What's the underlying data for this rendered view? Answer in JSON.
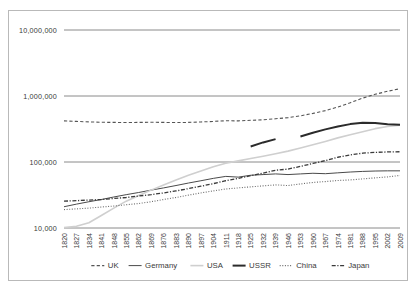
{
  "chart_data": {
    "type": "line",
    "title": "",
    "subtitle": "",
    "xlabel": "",
    "ylabel": "",
    "yscale": "log",
    "ylim": [
      10000,
      10000000
    ],
    "y_ticks": [
      10000,
      100000,
      1000000,
      10000000
    ],
    "y_tick_labels": [
      "10,000",
      "100,000",
      "1,000,000",
      "10,000,000"
    ],
    "grid": true,
    "legend_position": "bottom",
    "x": [
      1820,
      1827,
      1834,
      1841,
      1848,
      1855,
      1862,
      1869,
      1876,
      1883,
      1890,
      1897,
      1904,
      1911,
      1918,
      1925,
      1932,
      1939,
      1946,
      1953,
      1960,
      1967,
      1974,
      1981,
      1988,
      1995,
      2002,
      2009
    ],
    "x_tick_labels": [
      "1820",
      "1827",
      "1834",
      "1841",
      "1848",
      "1855",
      "1862",
      "1869",
      "1876",
      "1883",
      "1890",
      "1897",
      "1904",
      "1911",
      "1918",
      "1925",
      "1932",
      "1939",
      "1946",
      "1953",
      "1960",
      "1967",
      "1974",
      "1981",
      "1988",
      "1995",
      "2002",
      "2009"
    ],
    "series": [
      {
        "name": "UK",
        "style": "dashed",
        "color": "#555555",
        "width": 1.1,
        "values": [
          420000,
          412000,
          405000,
          400000,
          398000,
          397000,
          398000,
          400000,
          398000,
          396000,
          398000,
          404000,
          412000,
          422000,
          420000,
          428000,
          436000,
          452000,
          470000,
          500000,
          545000,
          600000,
          680000,
          790000,
          930000,
          1060000,
          1180000,
          1290000
        ]
      },
      {
        "name": "Germany",
        "style": "solid-thin",
        "color": "#4a4a4a",
        "width": 1.0,
        "values": [
          21000,
          23000,
          25000,
          27000,
          29500,
          32000,
          34500,
          37500,
          40500,
          44000,
          48000,
          52000,
          56500,
          60500,
          59000,
          63000,
          64500,
          66000,
          64500,
          66000,
          67500,
          66500,
          68500,
          70500,
          72000,
          73000,
          73500,
          73500
        ]
      },
      {
        "name": "USA",
        "style": "solid-light",
        "color": "#cfcfcf",
        "width": 1.6,
        "values": [
          10200,
          10600,
          12000,
          15500,
          20000,
          25500,
          31000,
          37500,
          45000,
          53500,
          63000,
          73000,
          85000,
          96000,
          104000,
          113000,
          122000,
          133000,
          146000,
          163000,
          182000,
          205000,
          232000,
          258000,
          288000,
          320000,
          345000,
          360000
        ]
      },
      {
        "name": "USSR",
        "style": "solid-thick",
        "color": "#2b2b2b",
        "width": 2.0,
        "values": [
          null,
          null,
          null,
          null,
          null,
          null,
          null,
          null,
          null,
          null,
          null,
          null,
          null,
          null,
          null,
          172000,
          198000,
          222000,
          null,
          244000,
          278000,
          312000,
          345000,
          375000,
          392000,
          390000,
          372000,
          368000
        ]
      },
      {
        "name": "China",
        "style": "dotted",
        "color": "#6a6a6a",
        "width": 1.1,
        "values": [
          19000,
          19500,
          20000,
          20800,
          21500,
          22500,
          23500,
          25000,
          27000,
          29000,
          31500,
          34000,
          36500,
          39000,
          40500,
          42000,
          43500,
          45000,
          44000,
          46500,
          49000,
          50500,
          52500,
          53500,
          55500,
          57500,
          59500,
          62500
        ]
      },
      {
        "name": "Japan",
        "style": "dash-dot",
        "color": "#3a3a3a",
        "width": 1.3,
        "values": [
          25500,
          26000,
          26500,
          27000,
          28000,
          29000,
          30500,
          32000,
          34000,
          36500,
          39500,
          43000,
          47000,
          52000,
          56500,
          62000,
          68000,
          75000,
          78000,
          86000,
          95000,
          105000,
          118000,
          128000,
          136000,
          140000,
          142000,
          143000
        ]
      }
    ]
  },
  "legend": {
    "items": [
      {
        "label": "UK",
        "marker": "dashed"
      },
      {
        "label": "Germany",
        "marker": "solid-thin"
      },
      {
        "label": "USA",
        "marker": "solid-light"
      },
      {
        "label": "USSR",
        "marker": "solid-thick"
      },
      {
        "label": "China",
        "marker": "dotted"
      },
      {
        "label": "Japan",
        "marker": "dash-dot"
      }
    ]
  },
  "colors": {
    "frame": "#b9b9b9",
    "gridline": "#8a8a8a",
    "text": "#3a3a3a",
    "background": "#ffffff"
  }
}
